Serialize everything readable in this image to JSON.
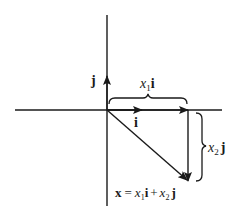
{
  "diagram": {
    "type": "vector-decomposition",
    "axes": {
      "horizontal": {
        "from": [
          15,
          110
        ],
        "to": [
          222,
          110
        ]
      },
      "vertical": {
        "from": [
          107,
          15
        ],
        "to": [
          107,
          206
        ]
      }
    },
    "origin": [
      107,
      110
    ],
    "unit_vectors": {
      "i": {
        "label": "i",
        "tip": [
          142,
          110
        ]
      },
      "j": {
        "label": "j",
        "tip": [
          107,
          76
        ]
      }
    },
    "components": {
      "x1i": {
        "var": "x",
        "sub": "1",
        "unit": "i",
        "from": [
          107,
          110
        ],
        "to": [
          188,
          110
        ]
      },
      "x2j": {
        "var": "x",
        "sub": "2",
        "unit": "j",
        "from": [
          188,
          110
        ],
        "to": [
          188,
          181
        ]
      }
    },
    "resultant": {
      "from": [
        107,
        110
      ],
      "to": [
        188,
        181
      ]
    },
    "equation": {
      "lhs": "x",
      "equals": "=",
      "term1_var": "x",
      "term1_sub": "1",
      "term1_unit": "i",
      "plus": "+",
      "term2_var": "x",
      "term2_sub": "2",
      "term2_unit": "j"
    },
    "labels": {
      "j_axis": "j",
      "i_axis": "i",
      "x1_var": "x",
      "x1_sub": "1",
      "x1_unit": "i",
      "x2_var": "x",
      "x2_sub": "2",
      "x2_unit": "j"
    },
    "colors": {
      "ink": "#1a1a1a",
      "background": "#ffffff"
    }
  }
}
